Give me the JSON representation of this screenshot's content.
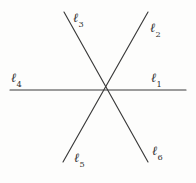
{
  "figure": {
    "kind": "line-diagram",
    "background_color": "#fdfdfc",
    "stroke_color": "#3a3a3a",
    "label_color": "#2e2e2e",
    "width": 196,
    "height": 183,
    "intersection": {
      "x": 105,
      "y": 90
    }
  },
  "lines": [
    {
      "name": "horizontal-line",
      "rays": [
        "l4",
        "l1"
      ],
      "x1": 10,
      "y1": 90,
      "x2": 186,
      "y2": 90
    },
    {
      "name": "upper-left-to-lower-right-line",
      "rays": [
        "l3",
        "l6"
      ],
      "x1": 64,
      "y1": 12,
      "x2": 148,
      "y2": 162
    },
    {
      "name": "lower-left-to-upper-right-line",
      "rays": [
        "l5",
        "l2"
      ],
      "x1": 63,
      "y1": 162,
      "x2": 148,
      "y2": 12
    }
  ],
  "labels": [
    {
      "id": "l1",
      "symbol": "ℓ",
      "subscript": "1",
      "text": "ℓ1",
      "x": 151,
      "y": 72
    },
    {
      "id": "l2",
      "symbol": "ℓ",
      "subscript": "2",
      "text": "ℓ2",
      "x": 150,
      "y": 22
    },
    {
      "id": "l3",
      "symbol": "ℓ",
      "subscript": "3",
      "text": "ℓ3",
      "x": 73,
      "y": 12
    },
    {
      "id": "l4",
      "symbol": "ℓ",
      "subscript": "4",
      "text": "ℓ4",
      "x": 11,
      "y": 72
    },
    {
      "id": "l5",
      "symbol": "ℓ",
      "subscript": "5",
      "text": "ℓ5",
      "x": 74,
      "y": 152
    },
    {
      "id": "l6",
      "symbol": "ℓ",
      "subscript": "6",
      "text": "ℓ6",
      "x": 152,
      "y": 145
    }
  ]
}
